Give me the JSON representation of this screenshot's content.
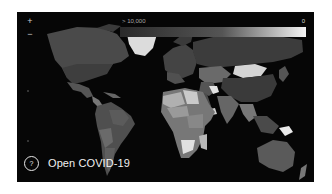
{
  "app": {
    "title": "Open COVID-19",
    "help_icon_glyph": "?"
  },
  "map": {
    "background": "#060606",
    "zoom_in_glyph": "+",
    "zoom_out_glyph": "−",
    "color_scale": {
      "min_label": "> 10,000",
      "max_label": "0",
      "start_color": "#2a2a2a",
      "end_color": "#f4f4f4"
    }
  }
}
